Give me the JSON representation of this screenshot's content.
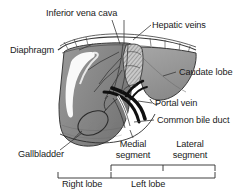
{
  "figure": {
    "labels": {
      "inferior_vena_cava": "Inferior vena cava",
      "hepatic_veins": "Hepatic veins",
      "diaphragm": "Diaphragm",
      "caudate_lobe": "Caudate lobe",
      "portal_vein": "Portal vein",
      "common_bile_duct": "Common bile duct",
      "gallbladder": "Gallbladder",
      "medial_segment": "Medial segment",
      "lateral_segment": "Lateral segment",
      "right_lobe": "Right lobe",
      "left_lobe": "Left lobe"
    },
    "colors": {
      "background": "#ffffff",
      "text": "#1a1a1a",
      "liver_body": "#8c8c8c",
      "liver_shadow": "#6f6f6f",
      "caudate_fill": "#9a9a9a",
      "highlight": "#ffffff",
      "vessel_dark": "#101010",
      "outline": "#2b2b2b",
      "leader_line": "#3a3a3a"
    }
  }
}
